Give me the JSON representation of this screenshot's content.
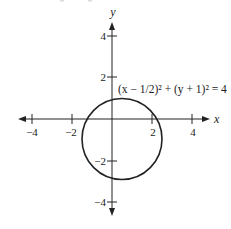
{
  "figure": {
    "type": "circle-graph",
    "equation": "(x − 1/2)² + (y + 1)² = 4",
    "x_axis_label": "x",
    "y_axis_label": "y",
    "x_ticks": [
      {
        "value": -4,
        "label": "−4"
      },
      {
        "value": -2,
        "label": "−2"
      },
      {
        "value": 2,
        "label": "2"
      },
      {
        "value": 4,
        "label": "4"
      }
    ],
    "y_ticks": [
      {
        "value": 4,
        "label": "4"
      },
      {
        "value": 2,
        "label": "2"
      },
      {
        "value": -2,
        "label": "−2"
      },
      {
        "value": -4,
        "label": "−4"
      }
    ],
    "circle": {
      "center_x": 0.5,
      "center_y": -1,
      "radius": 2
    },
    "colors": {
      "stroke": "#222222",
      "background": "#ffffff"
    }
  }
}
